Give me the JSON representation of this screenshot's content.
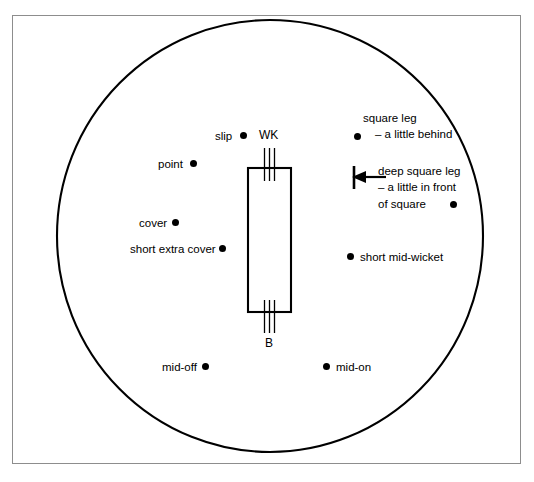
{
  "diagram": {
    "border_color": "#8d8d8d",
    "line_color": "#000000",
    "background": "#ffffff"
  },
  "pitch": {
    "wicketkeeper_label": "WK",
    "batsman_label": "B",
    "stumps_count": 3
  },
  "fielders": [
    {
      "id": "slip",
      "label": "slip",
      "label_side": "left",
      "label_x": 215,
      "label_y": 129,
      "dot_x": 240,
      "dot_y": 132
    },
    {
      "id": "point",
      "label": "point",
      "label_side": "left",
      "label_x": 158,
      "label_y": 157,
      "dot_x": 190,
      "dot_y": 160
    },
    {
      "id": "cover",
      "label": "cover",
      "label_side": "left",
      "label_x": 139,
      "label_y": 216,
      "dot_x": 172,
      "dot_y": 219
    },
    {
      "id": "short-extra-cover",
      "label": "short extra cover",
      "label_side": "left",
      "label_x": 130,
      "label_y": 242,
      "dot_x": 219,
      "dot_y": 245
    },
    {
      "id": "mid-off",
      "label": "mid-off",
      "label_side": "left",
      "label_x": 162,
      "label_y": 360,
      "dot_x": 202,
      "dot_y": 363
    },
    {
      "id": "mid-on",
      "label": "mid-on",
      "label_side": "right",
      "label_x": 336,
      "label_y": 360,
      "dot_x": 323,
      "dot_y": 363
    },
    {
      "id": "short-mid-wicket",
      "label": "short mid-wicket",
      "label_side": "right",
      "label_x": 360,
      "label_y": 250,
      "dot_x": 347,
      "dot_y": 253
    }
  ],
  "square_leg": {
    "line1": "square leg",
    "line2": "– a little behind",
    "line1_x": 363,
    "line1_y": 111,
    "line2_x": 375,
    "line2_y": 127,
    "dot_x": 354,
    "dot_y": 133
  },
  "deep_square_leg": {
    "line1": "deep square leg",
    "line2": "– a little in front",
    "line3": "of square",
    "text_x": 378,
    "text_y": 164,
    "dot_x": 450,
    "dot_y": 201,
    "arrow": {
      "tip_x": 352,
      "tail_x": 386,
      "y": 177
    }
  }
}
